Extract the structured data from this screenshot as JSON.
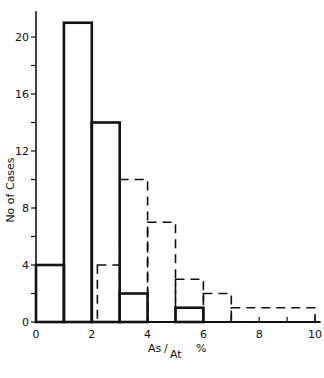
{
  "chart_data": {
    "type": "bar",
    "subtype": "histogram",
    "title": "",
    "xlabel": "As/At %",
    "xlabel_parts": {
      "num": "As",
      "den": "At",
      "unit": "%"
    },
    "ylabel": "No of Cases",
    "xlim": [
      0,
      10
    ],
    "ylim": [
      0,
      22
    ],
    "x_ticks": [
      0,
      2,
      4,
      6,
      8,
      10
    ],
    "x_minor_ticks": [
      1,
      3,
      5,
      7,
      9
    ],
    "y_ticks": [
      0,
      4,
      8,
      12,
      16,
      20
    ],
    "y_minor_ticks": [
      2,
      6,
      10,
      14,
      18
    ],
    "grid": false,
    "legend": null,
    "series": [
      {
        "name": "solid",
        "style": "solid",
        "bins": [
          {
            "x0": 0,
            "x1": 1,
            "value": 4
          },
          {
            "x0": 1,
            "x1": 2,
            "value": 21
          },
          {
            "x0": 2,
            "x1": 3,
            "value": 14
          },
          {
            "x0": 3,
            "x1": 4,
            "value": 2
          },
          {
            "x0": 4,
            "x1": 5,
            "value": 0
          },
          {
            "x0": 5,
            "x1": 6,
            "value": 1
          }
        ]
      },
      {
        "name": "dashed",
        "style": "dashed",
        "bins": [
          {
            "x0": 2.2,
            "x1": 3,
            "value": 4
          },
          {
            "x0": 3,
            "x1": 4,
            "value": 10
          },
          {
            "x0": 4,
            "x1": 5,
            "value": 7
          },
          {
            "x0": 5,
            "x1": 6,
            "value": 3
          },
          {
            "x0": 6,
            "x1": 7,
            "value": 2
          },
          {
            "x0": 7,
            "x1": 10,
            "value": 1
          }
        ]
      }
    ]
  }
}
